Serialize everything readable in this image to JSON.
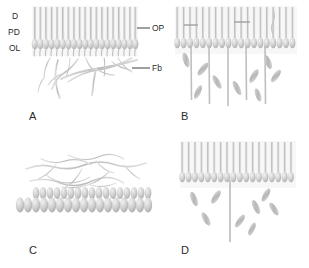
{
  "figure": {
    "background_color": "#ffffff",
    "ink_color": "#2b2b2b",
    "structure_color": "#c9c9c9",
    "structure_color_dark": "#a8a8a8",
    "structure_color_light": "#e2e2e2"
  },
  "panels": [
    {
      "id": "A",
      "letter": "A",
      "description": "Side view of sensory epithelium with dendrites, papillar dendrites, outer layer and branching nerve fibers",
      "units": 19,
      "labels": {
        "left": [
          {
            "key": "D",
            "text": "D"
          },
          {
            "key": "PD",
            "text": "PD"
          },
          {
            "key": "OL",
            "text": "OL"
          }
        ],
        "right": [
          {
            "key": "OP",
            "text": "OP"
          },
          {
            "key": "Fb",
            "text": "Fb"
          }
        ]
      }
    },
    {
      "id": "B",
      "letter": "B",
      "description": "Side view with connecting cross-bars, descending vertical fibers and spindle-shaped cells",
      "units": 19,
      "vertical_fibers": 5,
      "spindle_cells": 9,
      "cross_bars": 2
    },
    {
      "id": "C",
      "letter": "C",
      "description": "Oblique three-dimensional view of the bulb array with an overlying network of branching fibers",
      "rows": 2,
      "units_per_row": 17
    },
    {
      "id": "D",
      "letter": "D",
      "description": "Side view with a single central descending fiber and scattered spindle-shaped cells",
      "units": 18,
      "vertical_fibers": 1,
      "spindle_cells": 8
    }
  ]
}
